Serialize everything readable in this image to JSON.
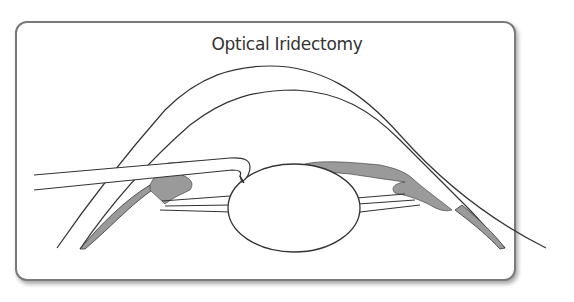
{
  "diagram": {
    "title": "Optical Iridectomy",
    "colors": {
      "line": "#333333",
      "iris_fill": "#9a9a9a",
      "frame_border": "#7a7a7a",
      "background": "#ffffff"
    },
    "components": [
      "cornea",
      "lens",
      "iris-left",
      "iris-right",
      "zonules-left",
      "zonules-right",
      "surgical-instrument"
    ]
  }
}
